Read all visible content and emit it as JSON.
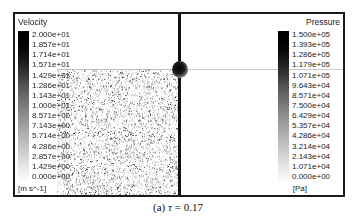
{
  "figure": {
    "caption_label": "(a)",
    "caption_symbol": "τ",
    "caption_equals": "=",
    "caption_value": "0.17"
  },
  "chart_data": {
    "type": "heatmap",
    "title": "",
    "panels": [
      {
        "name": "velocity-panel",
        "field": "Velocity",
        "units": "[m s^-1]",
        "colormap": "grayscale-black-to-white",
        "range": [
          0.0,
          20.0
        ],
        "tick_labels": [
          "2.000e+01",
          "1.857e+01",
          "1.714e+01",
          "1.571e+01",
          "1.429e+01",
          "1.286e+01",
          "1.143e+01",
          "1.000e+01",
          "8.571e+00",
          "7.143e+00",
          "5.714e+00",
          "4.286e+00",
          "2.857e+00",
          "1.429e+00",
          "0.000e+00"
        ],
        "tick_values": [
          20.0,
          18.57,
          17.14,
          15.71,
          14.29,
          12.86,
          11.43,
          10.0,
          8.571,
          7.143,
          5.714,
          4.286,
          2.857,
          1.429,
          0.0
        ],
        "content": "dense random particle speckle field filling lower-right of panel"
      },
      {
        "name": "pressure-panel",
        "field": "Pressure",
        "units": "[Pa]",
        "colormap": "grayscale-black-to-white",
        "range": [
          0.0,
          150000.0
        ],
        "tick_labels": [
          "1.500e+05",
          "1.393e+05",
          "1.286e+05",
          "1.179e+05",
          "1.071e+05",
          "9.643e+04",
          "8.571e+04",
          "7.500e+04",
          "6.429e+04",
          "5.357e+04",
          "4.286e+04",
          "3.214e+04",
          "2.143e+04",
          "1.071e+04",
          "0.000e+00"
        ],
        "tick_values": [
          150000,
          139300,
          128600,
          117900,
          107100,
          96430,
          85710,
          75000,
          64290,
          53570,
          42860,
          32140,
          21430,
          10710,
          0
        ],
        "content": "near-uniform white field with faint horizontal streamline"
      }
    ],
    "annotations": [
      {
        "name": "obstacle",
        "description": "dark circular obstacle on the panel divider",
        "x_frac": 0.49,
        "y_frac": 0.3
      },
      {
        "name": "streamline",
        "description": "faint horizontal gray line across both panels",
        "y_frac": 0.3
      }
    ]
  }
}
